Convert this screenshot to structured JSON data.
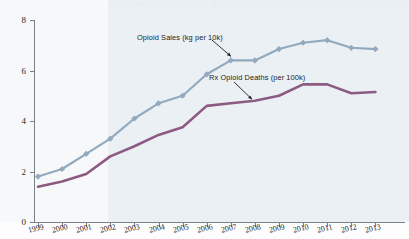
{
  "chart_data": {
    "type": "line",
    "title": "",
    "xlabel": "",
    "ylabel": "",
    "ylim": [
      0,
      8
    ],
    "yticks": [
      0,
      2,
      4,
      6,
      8
    ],
    "grid": false,
    "legend_position": "inline-annotations",
    "categories": [
      "1999",
      "2000",
      "2001",
      "2002",
      "2003",
      "2004",
      "2005",
      "2006",
      "2007",
      "2008",
      "2009",
      "2010",
      "2011",
      "2012",
      "2013"
    ],
    "series": [
      {
        "name": "Opioid Sales (kg per 10k)",
        "color": "#93a9bd",
        "marker": "diamond",
        "values": [
          1.8,
          2.1,
          2.7,
          3.3,
          4.1,
          4.7,
          5.0,
          5.85,
          6.4,
          6.4,
          6.85,
          7.1,
          7.2,
          6.9,
          6.85
        ]
      },
      {
        "name": "Rx Opioid Deaths (per 100k)",
        "color": "#8d5b82",
        "marker": "none",
        "values": [
          1.4,
          1.6,
          1.9,
          2.6,
          3.0,
          3.45,
          3.75,
          4.6,
          4.7,
          4.8,
          5.0,
          5.45,
          5.45,
          5.1,
          5.15
        ]
      }
    ],
    "annotations": [
      {
        "text": "Opioid Sales (kg per 10k)",
        "target_category": "2007",
        "target_series": "Opioid Sales (kg per 10k)"
      },
      {
        "text": "Rx Opioid Deaths (per 100k)",
        "target_category": "2007",
        "target_series": "Rx Opioid Deaths (per 100k)"
      }
    ]
  },
  "axes": {
    "y_tick_labels": [
      "0",
      "2",
      "4",
      "6",
      "8"
    ],
    "x_tick_labels": [
      "1999",
      "2000",
      "2001",
      "2002",
      "2003",
      "2004",
      "2005",
      "2006",
      "2007",
      "2008",
      "2009",
      "2010",
      "2011",
      "2012",
      "2013"
    ]
  },
  "colors": {
    "sales_line": "#93a9bd",
    "deaths_line": "#8d5b82",
    "axis": "#7b7f86",
    "shaded_panel": "#e7edf3",
    "text": "#2b2b2b"
  }
}
